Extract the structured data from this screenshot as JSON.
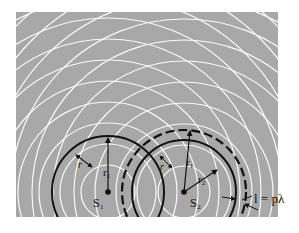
{
  "diagram": {
    "panel": {
      "x": 16,
      "y": 12,
      "width": 262,
      "height": 205,
      "fill": "#a8a8a8"
    },
    "wave_color": "#ffffff",
    "wavelength": 21,
    "sources": [
      {
        "id": "S1",
        "label": "S₁",
        "cx": 108,
        "cy": 192,
        "first_radius": 27,
        "rings": 12,
        "radius_label": "r₁",
        "highlight_circle": {
          "r": 56,
          "style": "solid"
        },
        "side_label": "r"
      },
      {
        "id": "S2",
        "label": "S₂",
        "cx": 184,
        "cy": 192,
        "first_radius": 26,
        "rings": 12,
        "radius_labels": [
          "r₁",
          "r₂"
        ],
        "highlight_circles": [
          {
            "r": 52,
            "style": "solid"
          },
          {
            "r": 62,
            "style": "dashed"
          }
        ],
        "side_label": "r"
      }
    ],
    "annotation": {
      "text": "l = pλ",
      "x": 243,
      "y": 207
    }
  }
}
